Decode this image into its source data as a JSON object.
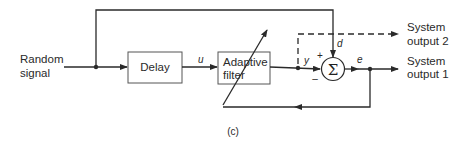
{
  "diagram": {
    "caption": "(c)",
    "input": {
      "line1": "Random",
      "line2": "signal"
    },
    "blocks": {
      "delay": "Delay",
      "adaptive_filter": {
        "line1": "Adaptive",
        "line2": "filter"
      }
    },
    "summing_junction": {
      "symbol": "Σ",
      "plus": "+",
      "minus": "–"
    },
    "signals": {
      "u": "u",
      "y": "y",
      "d": "d",
      "e": "e"
    },
    "outputs": {
      "output2": {
        "line1": "System",
        "line2": "output 2"
      },
      "output1": {
        "line1": "System",
        "line2": "output 1"
      }
    },
    "colors": {
      "stroke": "#2a2a2a",
      "text": "#2a2a2a",
      "background": "#ffffff"
    }
  }
}
